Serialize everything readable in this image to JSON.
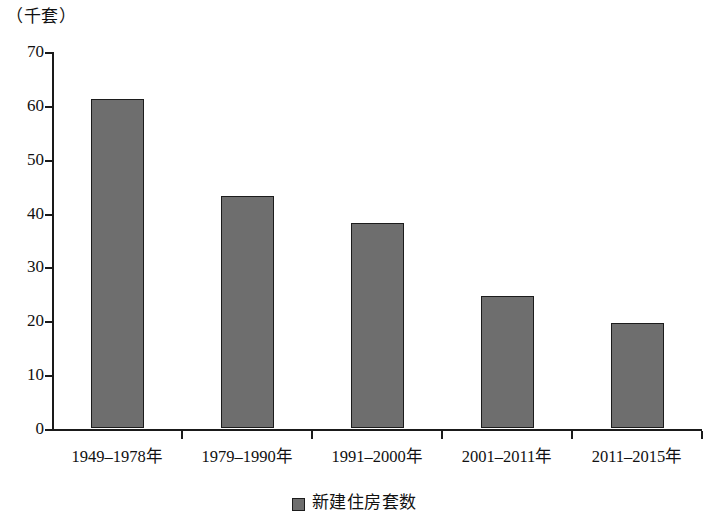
{
  "chart_data": {
    "type": "bar",
    "title": "",
    "subtitle": "",
    "unit_label": "（千套）",
    "xlabel": "",
    "ylabel": "",
    "categories": [
      "1949–1978年",
      "1979–1990年",
      "1991–2000年",
      "2001–2011年",
      "2011–2015年"
    ],
    "series": [
      {
        "name": "新建住房套数",
        "values": [
          61,
          43,
          38,
          24.5,
          19.5
        ],
        "color": "#6e6e6e"
      }
    ],
    "ylim": [
      0,
      70
    ],
    "ytick_values": [
      0,
      10,
      20,
      30,
      40,
      50,
      60,
      70
    ],
    "ytick_labels": [
      "0",
      "10",
      "20",
      "30",
      "40",
      "50",
      "60",
      "70"
    ],
    "grid": false,
    "legend": {
      "position": "bottom-center",
      "entries": [
        {
          "label": "新建住房套数",
          "swatch_color": "#6e6e6e",
          "marker": "square-swatch-icon"
        }
      ]
    },
    "axis_color": "#1a1a1a",
    "background": "#ffffff"
  }
}
